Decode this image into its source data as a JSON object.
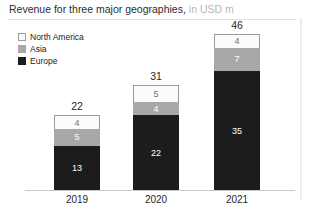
{
  "title": {
    "main": "Revenue for three major geographies,",
    "unit": "in USD m"
  },
  "legend": {
    "items": [
      {
        "label": "North America",
        "swatch": "legend-swatch-north-america",
        "color": "#fbfbfb"
      },
      {
        "label": "Asia",
        "swatch": "legend-swatch-asia",
        "color": "#a8a8a8"
      },
      {
        "label": "Europe",
        "swatch": "legend-swatch-europe",
        "color": "#1c1c1c"
      }
    ]
  },
  "chart_data": {
    "type": "bar",
    "subtype": "stacked-column",
    "xlabel": "",
    "ylabel": "",
    "unit": "USD m",
    "grid": false,
    "legend_position": "top-left",
    "axis_line": true,
    "ylim": [
      0,
      46
    ],
    "categories": [
      "2019",
      "2020",
      "2021"
    ],
    "series": [
      {
        "name": "Europe",
        "color": "#1c1c1c",
        "values": [
          13,
          22,
          35
        ]
      },
      {
        "name": "Asia",
        "color": "#a8a8a8",
        "values": [
          5,
          4,
          7
        ]
      },
      {
        "name": "North America",
        "color": "#fbfbfb",
        "values": [
          4,
          5,
          4
        ]
      }
    ],
    "totals": [
      22,
      31,
      46
    ],
    "stack_order_bottom_to_top": [
      "Europe",
      "Asia",
      "North America"
    ],
    "bars": [
      {
        "category": "2019",
        "total": 22,
        "total_label": "22",
        "segments": [
          {
            "name": "North America",
            "value": 4,
            "label": "4"
          },
          {
            "name": "Asia",
            "value": 5,
            "label": "5"
          },
          {
            "name": "Europe",
            "value": 13,
            "label": "13"
          }
        ]
      },
      {
        "category": "2020",
        "total": 31,
        "total_label": "31",
        "segments": [
          {
            "name": "North America",
            "value": 5,
            "label": "5"
          },
          {
            "name": "Asia",
            "value": 4,
            "label": "4"
          },
          {
            "name": "Europe",
            "value": 22,
            "label": "22"
          }
        ]
      },
      {
        "category": "2021",
        "total": 46,
        "total_label": "46",
        "segments": [
          {
            "name": "North America",
            "value": 4,
            "label": "4"
          },
          {
            "name": "Asia",
            "value": 7,
            "label": "7"
          },
          {
            "name": "Europe",
            "value": 35,
            "label": "35"
          }
        ]
      }
    ]
  }
}
